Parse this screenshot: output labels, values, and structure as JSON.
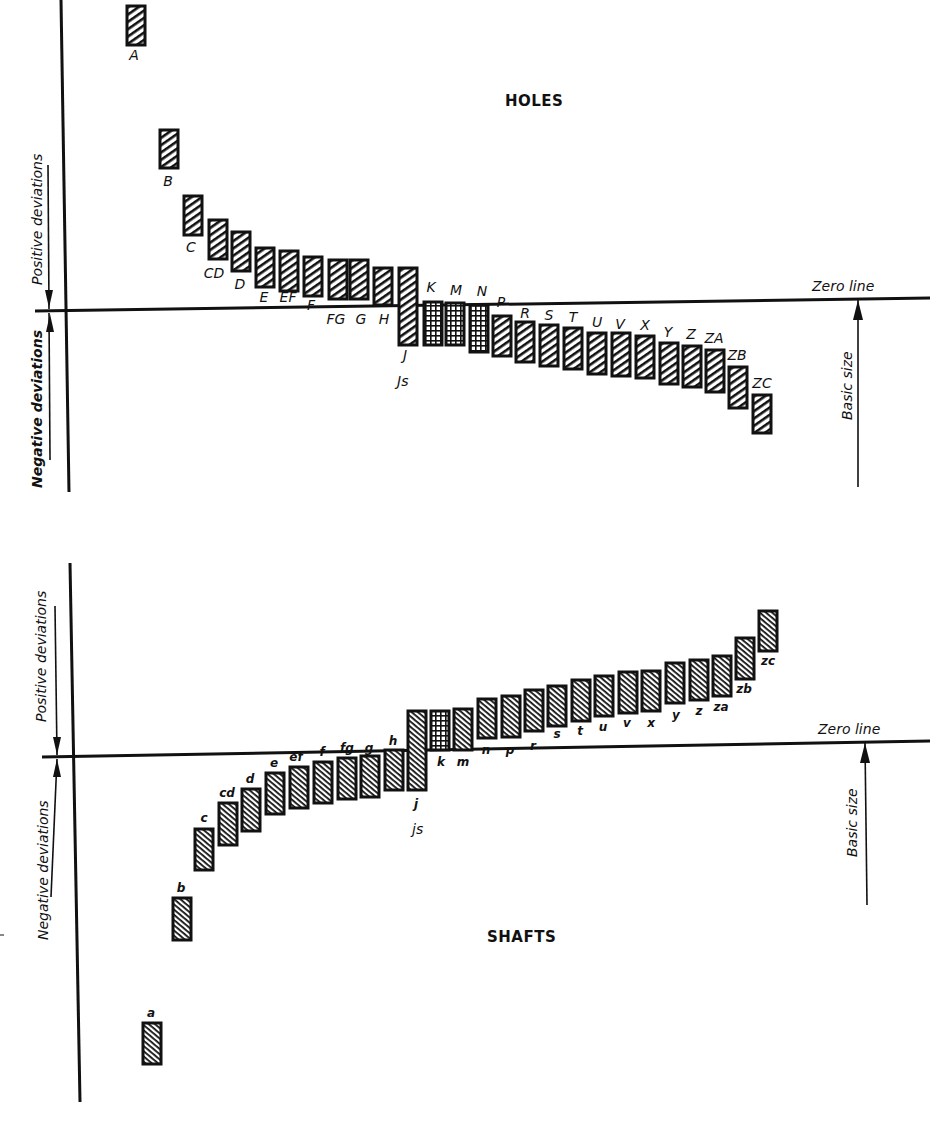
{
  "holes": {
    "title": "HOLES",
    "zero_line_label": "Zero line",
    "basic_size_label": "Basic size",
    "positive_label": "Positive deviations",
    "negative_label": "Negative deviations",
    "bars": [
      {
        "label": "A",
        "x": 127,
        "top": 6,
        "bottom": 45,
        "lx": 134,
        "ly": 60,
        "hatch": "fwd"
      },
      {
        "label": "B",
        "x": 160,
        "top": 130,
        "bottom": 168,
        "lx": 168,
        "ly": 186,
        "hatch": "fwd"
      },
      {
        "label": "C",
        "x": 184,
        "top": 196,
        "bottom": 235,
        "lx": 191,
        "ly": 252,
        "hatch": "fwd"
      },
      {
        "label": "CD",
        "x": 209,
        "top": 220,
        "bottom": 259,
        "lx": 214,
        "ly": 278,
        "hatch": "fwd"
      },
      {
        "label": "D",
        "x": 232,
        "top": 232,
        "bottom": 271,
        "lx": 240,
        "ly": 289,
        "hatch": "fwd"
      },
      {
        "label": "E",
        "x": 256,
        "top": 248,
        "bottom": 287,
        "lx": 264,
        "ly": 302,
        "hatch": "fwd"
      },
      {
        "label": "EF",
        "x": 280,
        "top": 251,
        "bottom": 291,
        "lx": 288,
        "ly": 302,
        "hatch": "fwd"
      },
      {
        "label": "F",
        "x": 304,
        "top": 257,
        "bottom": 296,
        "lx": 311,
        "ly": 310,
        "hatch": "fwd"
      },
      {
        "label": "FG",
        "x": 329,
        "top": 260,
        "bottom": 299,
        "lx": 336,
        "ly": 324,
        "hatch": "fwd"
      },
      {
        "label": "G",
        "x": 350,
        "top": 260,
        "bottom": 299,
        "lx": 361,
        "ly": 324,
        "hatch": "fwd"
      },
      {
        "label": "H",
        "x": 374,
        "top": 268,
        "bottom": 305,
        "lx": 384,
        "ly": 324,
        "hatch": "fwd"
      },
      {
        "label": "J",
        "x": 399,
        "top": 268,
        "bottom": 345,
        "lx": 405,
        "ly": 360,
        "hatch": "fwd"
      },
      {
        "label": "K",
        "x": 424,
        "top": 302,
        "bottom": 345,
        "lx": 431,
        "ly": 292,
        "hatch": "grid"
      },
      {
        "label": "M",
        "x": 446,
        "top": 303,
        "bottom": 345,
        "lx": 456,
        "ly": 295,
        "hatch": "grid"
      },
      {
        "label": "N",
        "x": 470,
        "top": 305,
        "bottom": 352,
        "lx": 482,
        "ly": 296,
        "hatch": "grid"
      },
      {
        "label": "P",
        "x": 493,
        "top": 316,
        "bottom": 356,
        "lx": 501,
        "ly": 307,
        "hatch": "fwd"
      },
      {
        "label": "R",
        "x": 516,
        "top": 322,
        "bottom": 362,
        "lx": 525,
        "ly": 318,
        "hatch": "fwd"
      },
      {
        "label": "S",
        "x": 540,
        "top": 325,
        "bottom": 366,
        "lx": 549,
        "ly": 320,
        "hatch": "fwd"
      },
      {
        "label": "T",
        "x": 564,
        "top": 328,
        "bottom": 369,
        "lx": 573,
        "ly": 322,
        "hatch": "fwd"
      },
      {
        "label": "U",
        "x": 588,
        "top": 333,
        "bottom": 374,
        "lx": 597,
        "ly": 327,
        "hatch": "fwd"
      },
      {
        "label": "V",
        "x": 612,
        "top": 333,
        "bottom": 376,
        "lx": 620,
        "ly": 329,
        "hatch": "fwd"
      },
      {
        "label": "X",
        "x": 636,
        "top": 336,
        "bottom": 378,
        "lx": 645,
        "ly": 330,
        "hatch": "fwd"
      },
      {
        "label": "Y",
        "x": 660,
        "top": 343,
        "bottom": 384,
        "lx": 668,
        "ly": 337,
        "hatch": "fwd"
      },
      {
        "label": "Z",
        "x": 683,
        "top": 346,
        "bottom": 387,
        "lx": 691,
        "ly": 339,
        "hatch": "fwd"
      },
      {
        "label": "ZA",
        "x": 706,
        "top": 350,
        "bottom": 392,
        "lx": 714,
        "ly": 343,
        "hatch": "fwd"
      },
      {
        "label": "ZB",
        "x": 729,
        "top": 367,
        "bottom": 408,
        "lx": 737,
        "ly": 360,
        "hatch": "fwd"
      },
      {
        "label": "ZC",
        "x": 753,
        "top": 395,
        "bottom": 433,
        "lx": 762,
        "ly": 388,
        "hatch": "fwd"
      }
    ],
    "js_label": "Js"
  },
  "shafts": {
    "title": "SHAFTS",
    "zero_line_label": "Zero line",
    "basic_size_label": "Basic size",
    "positive_label": "Positive deviations",
    "negative_label": "Negative deviations",
    "bars": [
      {
        "label": "a",
        "x": 143,
        "top": 1023,
        "bottom": 1064,
        "lx": 151,
        "ly": 1017,
        "hatch": "back"
      },
      {
        "label": "b",
        "x": 173,
        "top": 898,
        "bottom": 940,
        "lx": 181,
        "ly": 892,
        "hatch": "back"
      },
      {
        "label": "c",
        "x": 195,
        "top": 829,
        "bottom": 870,
        "lx": 204,
        "ly": 822,
        "hatch": "back"
      },
      {
        "label": "cd",
        "x": 219,
        "top": 803,
        "bottom": 845,
        "lx": 227,
        "ly": 797,
        "hatch": "back"
      },
      {
        "label": "d",
        "x": 242,
        "top": 789,
        "bottom": 831,
        "lx": 250,
        "ly": 783,
        "hatch": "back"
      },
      {
        "label": "e",
        "x": 266,
        "top": 773,
        "bottom": 814,
        "lx": 274,
        "ly": 767,
        "hatch": "back"
      },
      {
        "label": "ef",
        "x": 290,
        "top": 767,
        "bottom": 808,
        "lx": 296,
        "ly": 761,
        "hatch": "back"
      },
      {
        "label": "f",
        "x": 314,
        "top": 762,
        "bottom": 803,
        "lx": 322,
        "ly": 756,
        "hatch": "back"
      },
      {
        "label": "fg",
        "x": 338,
        "top": 758,
        "bottom": 799,
        "lx": 347,
        "ly": 752,
        "hatch": "back"
      },
      {
        "label": "g",
        "x": 361,
        "top": 756,
        "bottom": 797,
        "lx": 369,
        "ly": 752,
        "hatch": "back"
      },
      {
        "label": "h",
        "x": 385,
        "top": 750,
        "bottom": 790,
        "lx": 393,
        "ly": 745,
        "hatch": "back"
      },
      {
        "label": "j",
        "x": 408,
        "top": 711,
        "bottom": 790,
        "lx": 416,
        "ly": 808,
        "hatch": "back"
      },
      {
        "label": "k",
        "x": 431,
        "top": 711,
        "bottom": 750,
        "lx": 441,
        "ly": 766,
        "hatch": "grid"
      },
      {
        "label": "m",
        "x": 454,
        "top": 709,
        "bottom": 750,
        "lx": 463,
        "ly": 766,
        "hatch": "back"
      },
      {
        "label": "n",
        "x": 478,
        "top": 699,
        "bottom": 738,
        "lx": 486,
        "ly": 754,
        "hatch": "back"
      },
      {
        "label": "p",
        "x": 502,
        "top": 696,
        "bottom": 737,
        "lx": 510,
        "ly": 754,
        "hatch": "back"
      },
      {
        "label": "r",
        "x": 525,
        "top": 690,
        "bottom": 731,
        "lx": 533,
        "ly": 750,
        "hatch": "back"
      },
      {
        "label": "s",
        "x": 548,
        "top": 686,
        "bottom": 726,
        "lx": 557,
        "ly": 738,
        "hatch": "back"
      },
      {
        "label": "t",
        "x": 572,
        "top": 680,
        "bottom": 721,
        "lx": 580,
        "ly": 735,
        "hatch": "back"
      },
      {
        "label": "u",
        "x": 595,
        "top": 676,
        "bottom": 716,
        "lx": 603,
        "ly": 731,
        "hatch": "back"
      },
      {
        "label": "v",
        "x": 619,
        "top": 672,
        "bottom": 713,
        "lx": 627,
        "ly": 727,
        "hatch": "back"
      },
      {
        "label": "x",
        "x": 642,
        "top": 671,
        "bottom": 711,
        "lx": 651,
        "ly": 727,
        "hatch": "back"
      },
      {
        "label": "y",
        "x": 666,
        "top": 663,
        "bottom": 703,
        "lx": 676,
        "ly": 719,
        "hatch": "back"
      },
      {
        "label": "z",
        "x": 690,
        "top": 660,
        "bottom": 700,
        "lx": 699,
        "ly": 715,
        "hatch": "back"
      },
      {
        "label": "za",
        "x": 713,
        "top": 656,
        "bottom": 696,
        "lx": 721,
        "ly": 711,
        "hatch": "back"
      },
      {
        "label": "zb",
        "x": 736,
        "top": 638,
        "bottom": 679,
        "lx": 744,
        "ly": 693,
        "hatch": "back"
      },
      {
        "label": "zc",
        "x": 759,
        "top": 611,
        "bottom": 651,
        "lx": 768,
        "ly": 665,
        "hatch": "back"
      }
    ],
    "js_label": "js"
  }
}
